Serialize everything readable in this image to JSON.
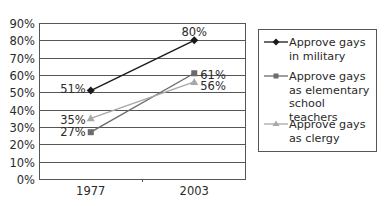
{
  "chart_data": {
    "type": "line",
    "title": "",
    "xlabel": "",
    "ylabel": "",
    "categories": [
      "1977",
      "2003"
    ],
    "x": [
      "1977",
      "2003"
    ],
    "ylim": [
      0,
      90
    ],
    "yticks": [
      "0%",
      "10%",
      "20%",
      "30%",
      "40%",
      "50%",
      "60%",
      "70%",
      "80%",
      "90%"
    ],
    "grid": true,
    "legend_position": "right",
    "series": [
      {
        "name": "Approve gays in military",
        "values": [
          51,
          80
        ],
        "labels": [
          "51%",
          "80%"
        ],
        "color": "#1a1a1a",
        "marker": "diamond"
      },
      {
        "name": "Approve gays as elementary school teachers",
        "values": [
          27,
          61
        ],
        "labels": [
          "27%",
          "61%"
        ],
        "color": "#6b6b6b",
        "marker": "square"
      },
      {
        "name": "Approve gays as clergy",
        "values": [
          35,
          56
        ],
        "labels": [
          "35%",
          "56%"
        ],
        "color": "#a8a8a8",
        "marker": "triangle"
      }
    ]
  },
  "legend": {
    "items": [
      {
        "line1": "Approve gays",
        "line2": "in military",
        "line3": ""
      },
      {
        "line1": "Approve gays",
        "line2": "as elementary",
        "line3": "school teachers"
      },
      {
        "line1": "Approve gays",
        "line2": "as clergy",
        "line3": ""
      }
    ]
  }
}
